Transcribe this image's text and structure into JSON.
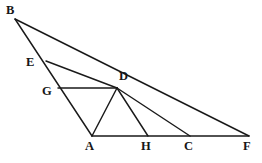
{
  "figure": {
    "stroke_color": "#1a1a1a",
    "background_color": "#ffffff",
    "label_color": "#161616",
    "width": 262,
    "height": 163,
    "points": {
      "B": {
        "name": "B",
        "x": 15,
        "y": 19,
        "label_x": 6,
        "label_y": 4
      },
      "E": {
        "name": "E",
        "x": 46,
        "y": 61,
        "label_x": 26,
        "label_y": 56
      },
      "G": {
        "name": "G",
        "x": 58,
        "y": 88,
        "label_x": 42,
        "label_y": 85
      },
      "D": {
        "name": "D",
        "x": 117,
        "y": 88,
        "label_x": 119,
        "label_y": 70
      },
      "A": {
        "name": "A",
        "x": 92,
        "y": 136,
        "label_x": 85,
        "label_y": 140
      },
      "H": {
        "name": "H",
        "x": 148,
        "y": 136,
        "label_x": 141,
        "label_y": 140
      },
      "C": {
        "name": "C",
        "x": 190,
        "y": 136,
        "label_x": 184,
        "label_y": 140
      },
      "F": {
        "name": "F",
        "x": 249,
        "y": 136,
        "label_x": 243,
        "label_y": 140
      }
    },
    "segments": [
      {
        "name": "segment-B-A",
        "from": "B",
        "to": "A",
        "note": "left side through E and G"
      },
      {
        "name": "segment-B-F",
        "from": "B",
        "to": "F",
        "note": "upper side through D"
      },
      {
        "name": "segment-A-F",
        "from": "A",
        "to": "F",
        "note": "baseline through H and C"
      },
      {
        "name": "segment-E-D",
        "from": "E",
        "to": "D"
      },
      {
        "name": "segment-G-D",
        "from": "G",
        "to": "D"
      },
      {
        "name": "segment-D-A",
        "from": "D",
        "to": "A"
      },
      {
        "name": "segment-D-H",
        "from": "D",
        "to": "H"
      },
      {
        "name": "segment-D-C",
        "from": "D",
        "to": "C"
      }
    ]
  }
}
